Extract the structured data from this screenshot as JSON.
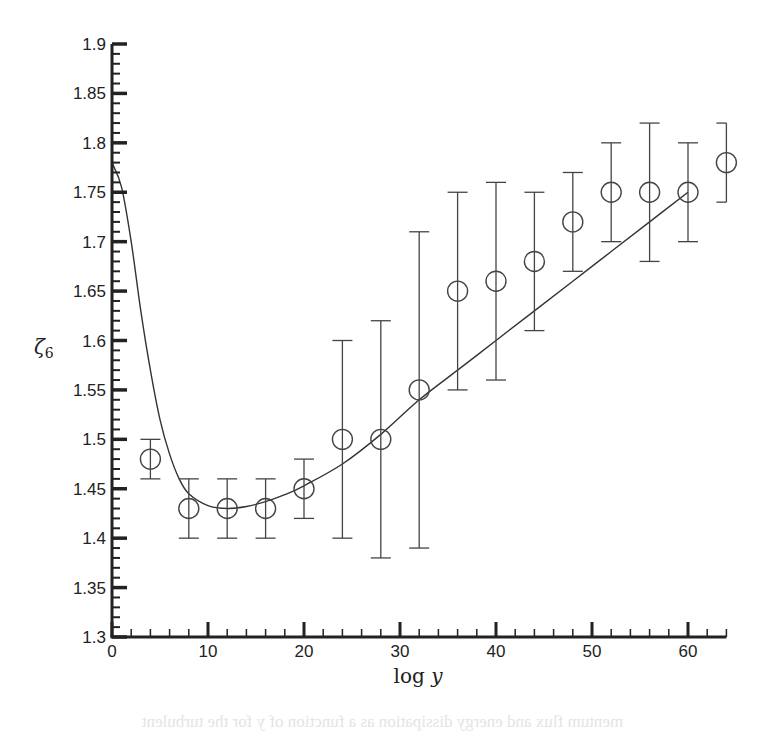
{
  "chart_data": {
    "type": "scatter",
    "title": "",
    "xlabel": "log y",
    "ylabel": "ζ6",
    "xlim": [
      0,
      64
    ],
    "ylim": [
      1.3,
      1.9
    ],
    "grid": false,
    "legend": null,
    "x_ticks": [
      0,
      10,
      20,
      30,
      40,
      50,
      60
    ],
    "x_tick_labels": [
      "0",
      "10",
      "20",
      "30",
      "40",
      "50",
      "60"
    ],
    "x_minor_step": 2,
    "y_ticks": [
      1.3,
      1.35,
      1.4,
      1.45,
      1.5,
      1.55,
      1.6,
      1.65,
      1.7,
      1.75,
      1.8,
      1.85,
      1.9
    ],
    "y_tick_labels": [
      "1.3",
      "1.35",
      "1.4",
      "1.45",
      "1.5",
      "1.55",
      "1.6",
      "1.65",
      "1.7",
      "1.75",
      "1.8",
      "1.85",
      "1.9"
    ],
    "y_minor_step": 0.01,
    "series": [
      {
        "name": "data",
        "marker": "open-circle",
        "x": [
          4,
          8,
          12,
          16,
          20,
          24,
          28,
          32,
          36,
          40,
          44,
          48,
          52,
          56,
          60,
          64
        ],
        "y": [
          1.48,
          1.43,
          1.43,
          1.43,
          1.45,
          1.5,
          1.5,
          1.55,
          1.65,
          1.66,
          1.68,
          1.72,
          1.75,
          1.75,
          1.75,
          1.78
        ],
        "err_low": [
          1.46,
          1.4,
          1.4,
          1.4,
          1.42,
          1.4,
          1.38,
          1.39,
          1.55,
          1.56,
          1.61,
          1.67,
          1.7,
          1.68,
          1.7,
          1.74
        ],
        "err_high": [
          1.5,
          1.46,
          1.46,
          1.46,
          1.48,
          1.6,
          1.62,
          1.71,
          1.75,
          1.76,
          1.75,
          1.77,
          1.8,
          1.82,
          1.8,
          1.82
        ]
      },
      {
        "name": "model",
        "style": "line",
        "x": [
          0,
          1,
          2,
          3,
          4,
          5,
          6,
          7,
          8,
          10,
          12,
          14,
          16,
          18,
          20,
          24,
          28,
          32,
          36,
          40,
          44,
          48,
          52,
          56,
          60
        ],
        "y": [
          1.78,
          1.755,
          1.7,
          1.63,
          1.57,
          1.52,
          1.485,
          1.46,
          1.445,
          1.433,
          1.43,
          1.432,
          1.437,
          1.444,
          1.453,
          1.475,
          1.505,
          1.54,
          1.57,
          1.6,
          1.63,
          1.66,
          1.69,
          1.72,
          1.75
        ]
      }
    ]
  },
  "bleed_text": "mentum flux and energy dissipation as a function of y for the turbulent"
}
